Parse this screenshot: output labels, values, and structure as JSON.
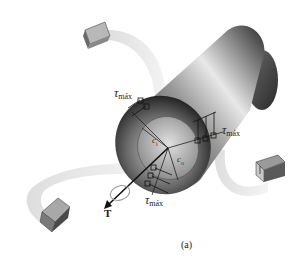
{
  "figure": {
    "caption": "(a)",
    "torque_label": "T",
    "shear_labels": [
      {
        "symbol": "τ",
        "subscript": "máx"
      },
      {
        "symbol": "τ",
        "subscript": "máx"
      },
      {
        "symbol": "τ",
        "subscript": "máx"
      }
    ],
    "radius_labels": [
      {
        "symbol": "c",
        "subscript": "i"
      },
      {
        "symbol": "c",
        "subscript": "o"
      }
    ],
    "elements": [
      "stress-element-top",
      "stress-element-right",
      "stress-element-left"
    ]
  }
}
